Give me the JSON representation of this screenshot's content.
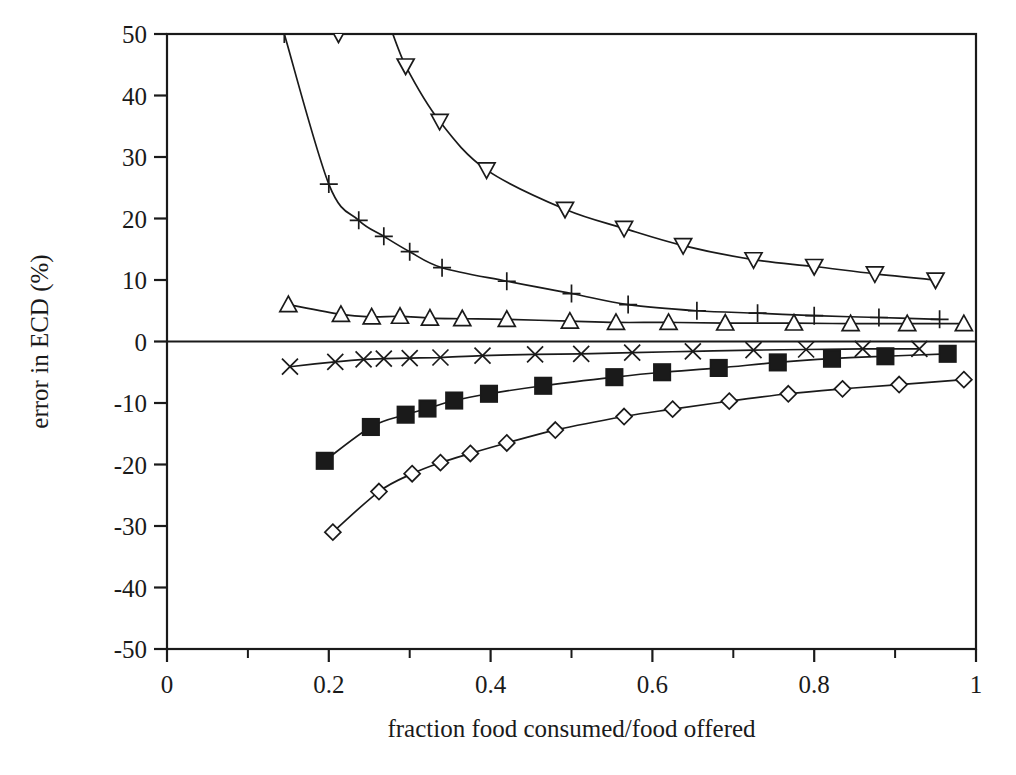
{
  "chart_data": {
    "type": "line",
    "title": "",
    "xlabel": "fraction food consumed/food offered",
    "ylabel": "error in ECD (%)",
    "xlim": [
      0,
      1
    ],
    "ylim": [
      -50,
      50
    ],
    "xticks": [
      "0",
      "0.2",
      "0.4",
      "0.6",
      "0.8",
      "1"
    ],
    "xtick_values": [
      0,
      0.2,
      0.4,
      0.6,
      0.8,
      1
    ],
    "xminor_step": 0.1,
    "yticks": [
      "50",
      "40",
      "30",
      "20",
      "10",
      "0",
      "-10",
      "-20",
      "-30",
      "-40",
      "-50"
    ],
    "ytick_values": [
      50,
      40,
      30,
      20,
      10,
      0,
      -10,
      -20,
      -30,
      -40,
      -50
    ],
    "grid": false,
    "legend": "none",
    "zero_reference_line": 0,
    "series": [
      {
        "name": "down-triangle",
        "marker": "triangle-down",
        "fill": "open",
        "points": [
          {
            "x": 0.145,
            "y": 78.0
          },
          {
            "x": 0.178,
            "y": 62.0
          },
          {
            "x": 0.212,
            "y": 50.0
          },
          {
            "x": 0.253,
            "y": 57.0
          },
          {
            "x": 0.295,
            "y": 44.8
          },
          {
            "x": 0.337,
            "y": 35.8
          },
          {
            "x": 0.395,
            "y": 27.9
          },
          {
            "x": 0.492,
            "y": 21.5
          },
          {
            "x": 0.565,
            "y": 18.4
          },
          {
            "x": 0.638,
            "y": 15.6
          },
          {
            "x": 0.725,
            "y": 13.3
          },
          {
            "x": 0.8,
            "y": 12.2
          },
          {
            "x": 0.875,
            "y": 11.0
          },
          {
            "x": 0.95,
            "y": 10.0
          }
        ]
      },
      {
        "name": "plus",
        "marker": "plus",
        "fill": "open",
        "points": [
          {
            "x": 0.145,
            "y": 50.0
          },
          {
            "x": 0.2,
            "y": 25.6
          },
          {
            "x": 0.237,
            "y": 19.7
          },
          {
            "x": 0.268,
            "y": 17.1
          },
          {
            "x": 0.3,
            "y": 14.6
          },
          {
            "x": 0.34,
            "y": 12.0
          },
          {
            "x": 0.42,
            "y": 9.8
          },
          {
            "x": 0.5,
            "y": 7.8
          },
          {
            "x": 0.57,
            "y": 6.0
          },
          {
            "x": 0.655,
            "y": 5.0
          },
          {
            "x": 0.73,
            "y": 4.6
          },
          {
            "x": 0.8,
            "y": 4.2
          },
          {
            "x": 0.88,
            "y": 3.9
          },
          {
            "x": 0.955,
            "y": 3.6
          }
        ]
      },
      {
        "name": "up-triangle",
        "marker": "triangle-up",
        "fill": "open",
        "points": [
          {
            "x": 0.15,
            "y": 6.0
          },
          {
            "x": 0.215,
            "y": 4.4
          },
          {
            "x": 0.253,
            "y": 4.0
          },
          {
            "x": 0.288,
            "y": 4.1
          },
          {
            "x": 0.325,
            "y": 3.8
          },
          {
            "x": 0.365,
            "y": 3.7
          },
          {
            "x": 0.42,
            "y": 3.6
          },
          {
            "x": 0.498,
            "y": 3.3
          },
          {
            "x": 0.555,
            "y": 3.1
          },
          {
            "x": 0.62,
            "y": 3.1
          },
          {
            "x": 0.69,
            "y": 3.0
          },
          {
            "x": 0.775,
            "y": 3.0
          },
          {
            "x": 0.845,
            "y": 2.9
          },
          {
            "x": 0.915,
            "y": 2.9
          },
          {
            "x": 0.985,
            "y": 2.9
          }
        ]
      },
      {
        "name": "cross",
        "marker": "x-cross",
        "fill": "open",
        "points": [
          {
            "x": 0.152,
            "y": -4.1
          },
          {
            "x": 0.208,
            "y": -3.3
          },
          {
            "x": 0.243,
            "y": -2.9
          },
          {
            "x": 0.268,
            "y": -2.8
          },
          {
            "x": 0.3,
            "y": -2.7
          },
          {
            "x": 0.338,
            "y": -2.6
          },
          {
            "x": 0.39,
            "y": -2.3
          },
          {
            "x": 0.455,
            "y": -2.1
          },
          {
            "x": 0.512,
            "y": -2.0
          },
          {
            "x": 0.575,
            "y": -1.8
          },
          {
            "x": 0.65,
            "y": -1.6
          },
          {
            "x": 0.725,
            "y": -1.4
          },
          {
            "x": 0.79,
            "y": -1.3
          },
          {
            "x": 0.86,
            "y": -1.2
          },
          {
            "x": 0.93,
            "y": -1.2
          }
        ]
      },
      {
        "name": "filled-square",
        "marker": "square",
        "fill": "filled",
        "points": [
          {
            "x": 0.195,
            "y": -19.4
          },
          {
            "x": 0.252,
            "y": -13.9
          },
          {
            "x": 0.295,
            "y": -11.9
          },
          {
            "x": 0.322,
            "y": -10.9
          },
          {
            "x": 0.355,
            "y": -9.6
          },
          {
            "x": 0.398,
            "y": -8.5
          },
          {
            "x": 0.465,
            "y": -7.2
          },
          {
            "x": 0.553,
            "y": -5.8
          },
          {
            "x": 0.612,
            "y": -5.0
          },
          {
            "x": 0.682,
            "y": -4.3
          },
          {
            "x": 0.755,
            "y": -3.4
          },
          {
            "x": 0.822,
            "y": -2.8
          },
          {
            "x": 0.888,
            "y": -2.4
          },
          {
            "x": 0.965,
            "y": -2.0
          }
        ]
      },
      {
        "name": "open-diamond",
        "marker": "diamond",
        "fill": "open",
        "points": [
          {
            "x": 0.205,
            "y": -31.0
          },
          {
            "x": 0.262,
            "y": -24.4
          },
          {
            "x": 0.303,
            "y": -21.5
          },
          {
            "x": 0.338,
            "y": -19.7
          },
          {
            "x": 0.375,
            "y": -18.2
          },
          {
            "x": 0.42,
            "y": -16.5
          },
          {
            "x": 0.48,
            "y": -14.4
          },
          {
            "x": 0.565,
            "y": -12.2
          },
          {
            "x": 0.625,
            "y": -11.0
          },
          {
            "x": 0.695,
            "y": -9.7
          },
          {
            "x": 0.768,
            "y": -8.5
          },
          {
            "x": 0.835,
            "y": -7.7
          },
          {
            "x": 0.905,
            "y": -7.0
          },
          {
            "x": 0.985,
            "y": -6.2
          }
        ]
      }
    ],
    "colors": {
      "axis": "#1a1a1a",
      "curve": "#1a1a1a",
      "background": "#ffffff"
    }
  }
}
